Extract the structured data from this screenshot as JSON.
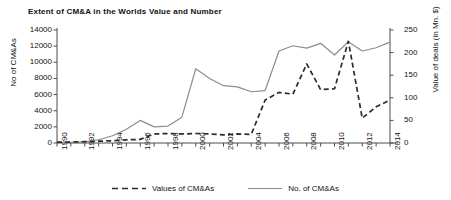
{
  "chart_data": {
    "type": "line",
    "title": "Extent of CM&A in the Worlds Value and Number",
    "xlabel": "",
    "ylabel": "No of CM&As",
    "y2label": "Value of deals (in Mn. $)",
    "x": [
      1990,
      1991,
      1992,
      1993,
      1994,
      1995,
      1996,
      1997,
      1998,
      1999,
      2000,
      2001,
      2002,
      2003,
      2004,
      2005,
      2006,
      2007,
      2008,
      2009,
      2010,
      2011,
      2012,
      2013,
      2014
    ],
    "xticklabels": [
      "1990",
      "1992",
      "1994",
      "1996",
      "1998",
      "2000",
      "2002",
      "2004",
      "2006",
      "2008",
      "2010",
      "2012",
      "2014"
    ],
    "ylim": [
      0,
      14000
    ],
    "yticks": [
      0,
      2000,
      4000,
      6000,
      8000,
      10000,
      12000,
      14000
    ],
    "y2lim": [
      0,
      250
    ],
    "y2ticks": [
      0,
      50,
      100,
      150,
      200,
      250
    ],
    "grid": false,
    "legend_position": "bottom",
    "series": [
      {
        "name": "No. of CM&As",
        "axis": "left",
        "style": "solid",
        "color": "#8c8c8c",
        "values": [
          60,
          80,
          150,
          400,
          900,
          1700,
          2800,
          2000,
          2100,
          3200,
          9200,
          8000,
          7100,
          6950,
          6350,
          6500,
          11400,
          12050,
          11750,
          12350,
          10900,
          12550,
          11400,
          11800,
          12500
        ]
      },
      {
        "name": "Values of CM&As",
        "axis": "right",
        "style": "dashed",
        "color": "#2b2b2b",
        "values": [
          2,
          2,
          3,
          4,
          5,
          7,
          8,
          20,
          21,
          20,
          21,
          20,
          18,
          20,
          19,
          95,
          112,
          108,
          175,
          118,
          120,
          225,
          55,
          80,
          95
        ]
      }
    ]
  },
  "legend": {
    "items": [
      {
        "label": "Values of CM&As",
        "style": "dashed"
      },
      {
        "label": "No. of CM&As",
        "style": "solid"
      }
    ]
  }
}
